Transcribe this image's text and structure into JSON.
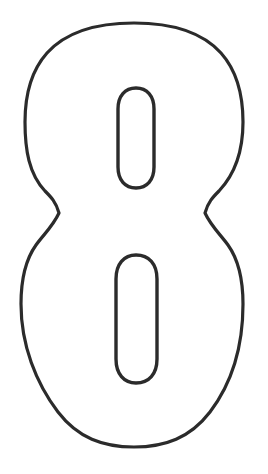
{
  "page": {
    "kind": "outlined-numeral-stencil",
    "background_color": "#ffffff",
    "width": 268,
    "height": 474
  },
  "figure": {
    "name": "digit-eight-outline",
    "character": "8",
    "stroke_color": "#2b2b2b",
    "fill_color": "#ffffff",
    "stroke_width": "3.2",
    "outer_bounds": {
      "top": 23,
      "bottom": 447,
      "left": 21,
      "right": 243
    },
    "waist": {
      "left_x": 59,
      "right_x": 205,
      "y": 213
    },
    "counters": [
      {
        "name": "upper-counter",
        "left": 118,
        "right": 154,
        "top": 88,
        "bottom": 188
      },
      {
        "name": "lower-counter",
        "left": 116,
        "right": 157,
        "top": 255,
        "bottom": 383
      }
    ]
  }
}
